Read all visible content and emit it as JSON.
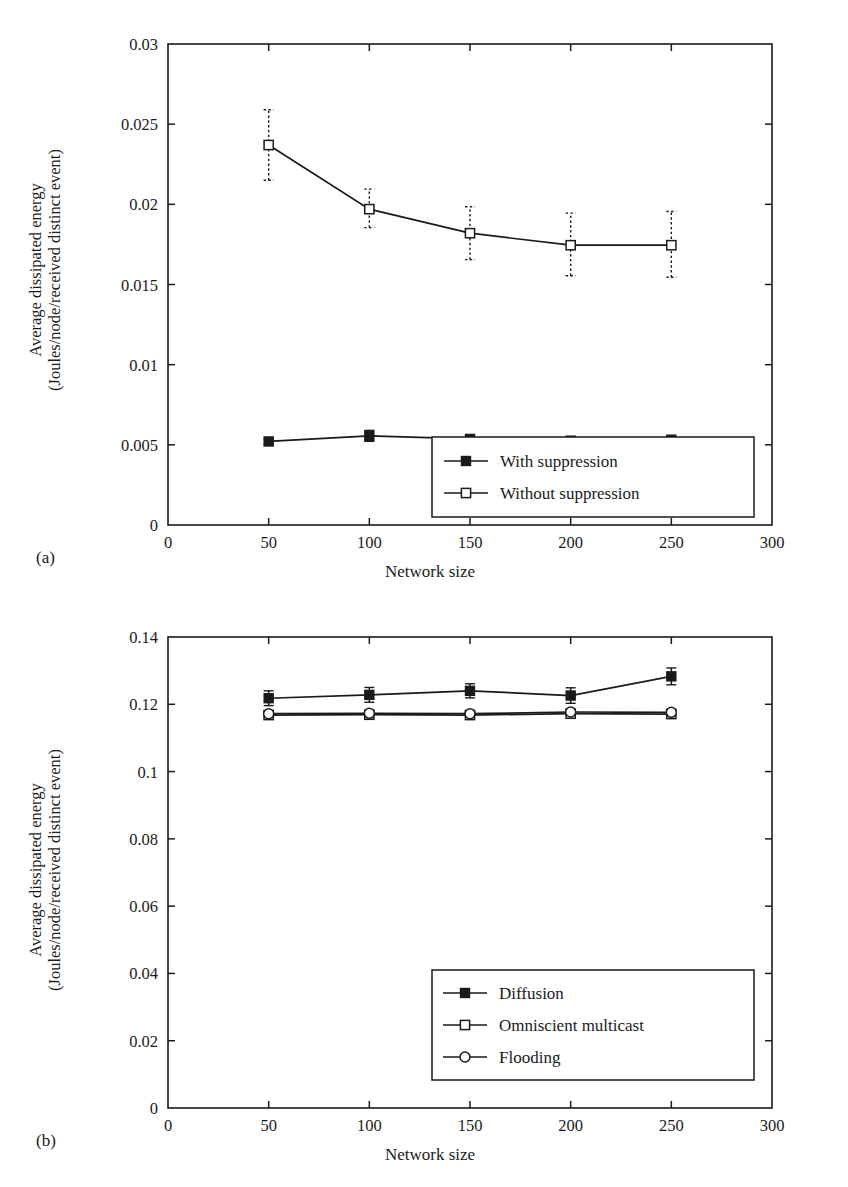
{
  "panels": [
    {
      "id": "a",
      "panel_label": "(a)",
      "ylabel_line1": "Average dissipated energy",
      "ylabel_line2": "(Joules/node/received distinct event)",
      "xlabel": "Network size"
    },
    {
      "id": "b",
      "panel_label": "(b)",
      "ylabel_line1": "Average dissipated energy",
      "ylabel_line2": "(Joules/node/received distinct event)",
      "xlabel": "Network size"
    }
  ],
  "chart_data": [
    {
      "type": "line",
      "title": "",
      "panel": "(a)",
      "xlabel": "Network size",
      "ylabel": "Average dissipated energy (Joules/node/received distinct event)",
      "x": [
        50,
        100,
        150,
        200,
        250
      ],
      "xlim": [
        0,
        300
      ],
      "ylim": [
        0,
        0.03
      ],
      "xticks": [
        0,
        50,
        100,
        150,
        200,
        250,
        300
      ],
      "xticklabels": [
        "0",
        "50",
        "100",
        "150",
        "200",
        "250",
        "300"
      ],
      "yticks": [
        0,
        0.005,
        0.01,
        0.015,
        0.02,
        0.025,
        0.03
      ],
      "yticklabels": [
        "0",
        "0.005",
        "0.01",
        "0.015",
        "0.02",
        "0.025",
        "0.03"
      ],
      "grid": false,
      "legend_position": "lower right",
      "series": [
        {
          "name": "With suppression",
          "marker": "filled-square",
          "errorbar_style": "solid",
          "values": [
            0.00521,
            0.00556,
            0.00537,
            0.00526,
            0.00532
          ],
          "err_low": [
            0.00505,
            0.00522,
            0.00516,
            0.00508,
            0.00512
          ],
          "err_high": [
            0.00537,
            0.0059,
            0.00558,
            0.00544,
            0.00552
          ]
        },
        {
          "name": "Without suppression",
          "marker": "open-square",
          "errorbar_style": "dashed",
          "values": [
            0.0237,
            0.0197,
            0.0182,
            0.01745,
            0.01745
          ],
          "err_low": [
            0.0215,
            0.01855,
            0.01655,
            0.01555,
            0.01545
          ],
          "err_high": [
            0.0259,
            0.02095,
            0.01985,
            0.01945,
            0.01955
          ]
        }
      ]
    },
    {
      "type": "line",
      "title": "",
      "panel": "(b)",
      "xlabel": "Network size",
      "ylabel": "Average dissipated energy (Joules/node/received distinct event)",
      "x": [
        50,
        100,
        150,
        200,
        250
      ],
      "xlim": [
        0,
        300
      ],
      "ylim": [
        0,
        0.14
      ],
      "xticks": [
        0,
        50,
        100,
        150,
        200,
        250,
        300
      ],
      "xticklabels": [
        "0",
        "50",
        "100",
        "150",
        "200",
        "250",
        "300"
      ],
      "yticks": [
        0,
        0.02,
        0.04,
        0.06,
        0.08,
        0.1,
        0.12,
        0.14
      ],
      "yticklabels": [
        "0",
        "0.02",
        "0.04",
        "0.06",
        "0.08",
        "0.1",
        "0.12",
        "0.14"
      ],
      "grid": false,
      "legend_position": "lower right",
      "series": [
        {
          "name": "Diffusion",
          "marker": "filled-square",
          "errorbar_style": "solid",
          "values": [
            0.1218,
            0.1228,
            0.124,
            0.1226,
            0.1283
          ],
          "err_low": [
            0.1196,
            0.1206,
            0.1219,
            0.1203,
            0.1258
          ],
          "err_high": [
            0.124,
            0.125,
            0.1261,
            0.1249,
            0.1308
          ]
        },
        {
          "name": "Omniscient multicast",
          "marker": "open-square",
          "errorbar_style": "solid",
          "values": [
            0.1168,
            0.1169,
            0.1168,
            0.1172,
            0.1171
          ],
          "err_low": [
            0.1168,
            0.1169,
            0.1168,
            0.1172,
            0.1171
          ],
          "err_high": [
            0.1168,
            0.1169,
            0.1168,
            0.1172,
            0.1171
          ]
        },
        {
          "name": "Flooding",
          "marker": "open-circle",
          "errorbar_style": "solid",
          "values": [
            0.1172,
            0.1173,
            0.1172,
            0.1177,
            0.1176
          ],
          "err_low": [
            0.1172,
            0.1173,
            0.1172,
            0.1177,
            0.1176
          ],
          "err_high": [
            0.1172,
            0.1173,
            0.1172,
            0.1177,
            0.1176
          ]
        }
      ]
    }
  ]
}
